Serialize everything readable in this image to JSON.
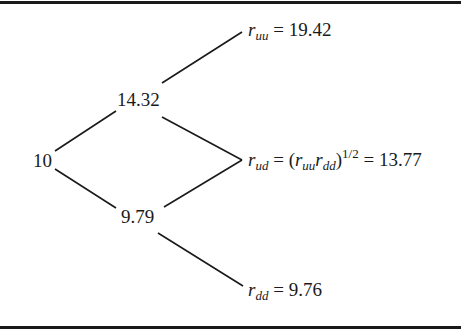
{
  "diagram": {
    "type": "binomial-interest-rate-tree",
    "nodes": {
      "root": {
        "value": "10"
      },
      "up": {
        "value": "14.32"
      },
      "down": {
        "value": "9.79"
      },
      "uu": {
        "symbol": "r",
        "subscript": "uu",
        "equals": "=",
        "value": "19.42"
      },
      "ud": {
        "symbol": "r",
        "subscript": "ud",
        "equals": "=",
        "open_paren": "(",
        "sym1": "r",
        "sub1": "uu",
        "sym2": "r",
        "sub2": "dd",
        "close_paren": ")",
        "exponent": "1/2",
        "equals2": "=",
        "value": "13.77"
      },
      "dd": {
        "symbol": "r",
        "subscript": "dd",
        "equals": "=",
        "value": "9.76"
      }
    },
    "edges": [
      {
        "from": "root",
        "to": "up"
      },
      {
        "from": "root",
        "to": "down"
      },
      {
        "from": "up",
        "to": "uu"
      },
      {
        "from": "up",
        "to": "ud"
      },
      {
        "from": "down",
        "to": "ud"
      },
      {
        "from": "down",
        "to": "dd"
      }
    ],
    "colors": {
      "line": "#1a1a1a",
      "text": "#1a1a1a",
      "background": "#ffffff"
    }
  }
}
